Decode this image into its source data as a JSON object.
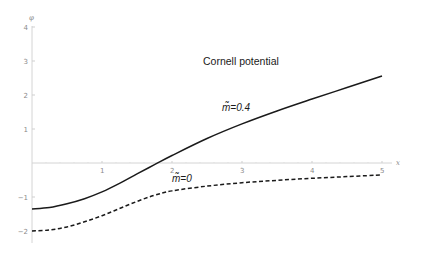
{
  "chart_data": {
    "type": "line",
    "title": "Cornell potential",
    "xlabel": "x",
    "ylabel": "φ",
    "xlim": [
      0,
      5
    ],
    "ylim": [
      -2.4,
      4.2
    ],
    "grid": false,
    "legend": "inline annotations",
    "x_ticks": [
      1,
      2,
      3,
      4,
      5
    ],
    "x_tick_labels": [
      "1",
      "2",
      "3",
      "4",
      "5"
    ],
    "y_ticks": [
      -2,
      -1,
      1,
      2,
      3,
      4
    ],
    "y_tick_labels": [
      "−2",
      "−1",
      "1",
      "2",
      "3",
      "4"
    ],
    "x": [
      0,
      0.25,
      0.5,
      0.75,
      1.0,
      1.25,
      1.5,
      1.75,
      2.0,
      2.5,
      3.0,
      3.5,
      4.0,
      4.5,
      5.0
    ],
    "series": [
      {
        "name": "m̃=0.4",
        "style": "solid",
        "color": "#1a1a1a",
        "values": [
          -1.35,
          -1.31,
          -1.2,
          -1.05,
          -0.85,
          -0.6,
          -0.32,
          -0.05,
          0.22,
          0.72,
          1.15,
          1.53,
          1.88,
          2.22,
          2.56
        ]
      },
      {
        "name": "m̃=0",
        "style": "dashed",
        "color": "#1a1a1a",
        "values": [
          -2.0,
          -1.97,
          -1.88,
          -1.73,
          -1.55,
          -1.34,
          -1.13,
          -0.95,
          -0.82,
          -0.68,
          -0.58,
          -0.51,
          -0.45,
          -0.4,
          -0.35
        ]
      }
    ],
    "annotations": [
      {
        "text": "Cornell potential",
        "x": 3.0,
        "y": 3.05
      },
      {
        "text": "m̃=0.4",
        "x": 2.75,
        "y": 1.65
      },
      {
        "text": "m̃=0",
        "x": 1.95,
        "y": -0.45
      }
    ]
  },
  "labels": {
    "title": "Cornell potential",
    "xlabel": "x",
    "ylabel": "φ",
    "anno_m04": "m̃=0.4",
    "anno_m0": "m̃=0"
  }
}
